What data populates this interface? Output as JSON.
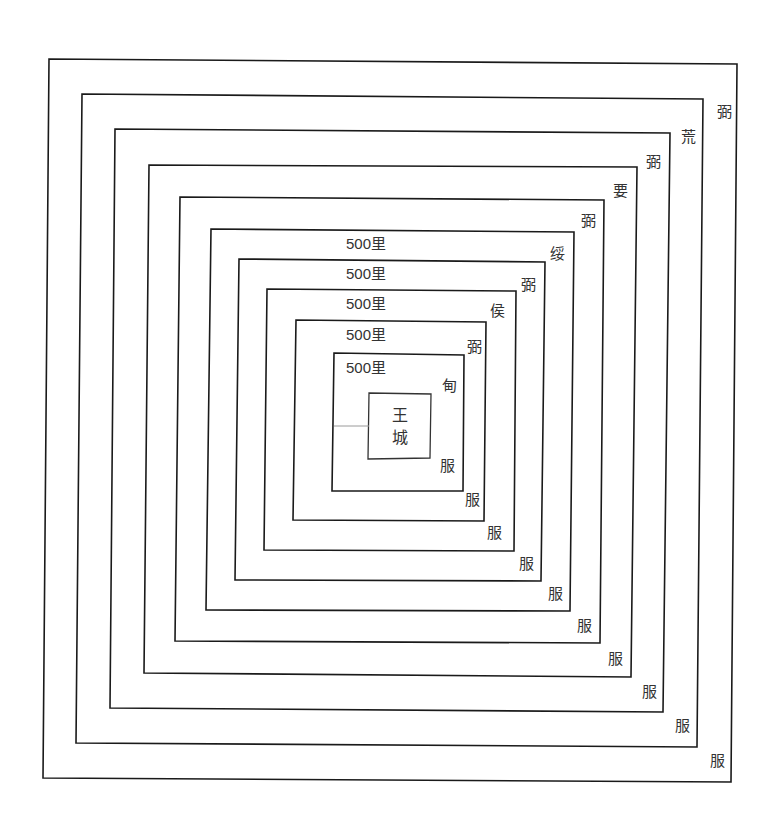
{
  "diagram": {
    "title": "",
    "center": {
      "line1": "王",
      "line2": "城"
    },
    "distance_labels": [
      "500里",
      "500里",
      "500里",
      "500里",
      "500里"
    ],
    "zones": [
      {
        "name": "甸服",
        "top_label": "甸",
        "bottom_label": "服"
      },
      {
        "name": "侯服",
        "top_label": "侯",
        "bottom_label": "服"
      },
      {
        "name": "绥服",
        "top_label": "绥",
        "bottom_label": "服"
      },
      {
        "name": "要服",
        "top_label": "要",
        "bottom_label": "服"
      },
      {
        "name": "荒服",
        "top_label": "荒",
        "bottom_label": "服"
      }
    ],
    "ring_labels": {
      "inner_ring_1": "弼",
      "inner_ring_2": "弼",
      "inner_ring_3": "弼",
      "inner_ring_4": "弼",
      "inner_ring_5": "弼"
    },
    "bottom_labels": [
      "服",
      "服",
      "服",
      "服",
      "服",
      "服",
      "服",
      "服",
      "服",
      "服"
    ],
    "line_color": "#1a1a1a",
    "text_color": "#333333"
  }
}
